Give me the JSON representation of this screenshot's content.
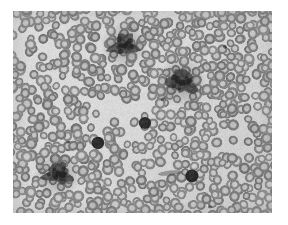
{
  "image": {
    "kind": "light-microscopy-photomicrograph",
    "subject": "peripheral blood smear",
    "title": "Peripheral blood smear photomicrograph",
    "alt_text": "Grayscale photomicrograph of a peripheral blood smear showing densely packed biconcave red blood cells with pale central pallor, several dark platelet clumps and a few small densely stained cells.",
    "color_mode": "grayscale",
    "canvas_width": 288,
    "canvas_height": 225,
    "border_color": "#ffffff",
    "plate": {
      "left": 13,
      "top": 11,
      "width": 259,
      "height": 202
    },
    "palette": {
      "page_background": "#ffffff",
      "field_background": "#dcdcda",
      "field_background_dark": "#c9c9c6",
      "rbc_rim": "#7e7e7c",
      "rbc_rim_dark": "#6a6a68",
      "rbc_center": "#bdbdbb",
      "dark_cell": "#2e2e2e",
      "clump": "#4a4a48",
      "vignette": "#b5b5b2"
    },
    "field": {
      "rbc_count": 780,
      "rbc_diameter_px": 10.5,
      "rbc_diameter_variation_px": 2.0,
      "seed": 20240517
    },
    "features": [
      {
        "id": "clump-top-center",
        "label": "platelet clump",
        "type": "clump",
        "x": 124,
        "y": 45,
        "rx": 13,
        "ry": 10,
        "rotation": -18,
        "darkness": 0.7
      },
      {
        "id": "clump-mid-right",
        "label": "platelet clump",
        "type": "clump",
        "x": 182,
        "y": 82,
        "rx": 14,
        "ry": 11,
        "rotation": 24,
        "darkness": 0.74
      },
      {
        "id": "clump-lower-left",
        "label": "platelet clump",
        "type": "clump",
        "x": 58,
        "y": 174,
        "rx": 13,
        "ry": 10,
        "rotation": 12,
        "darkness": 0.72
      },
      {
        "id": "dark-cell-center",
        "label": "densely stained cell",
        "type": "dark_cell",
        "x": 145,
        "y": 123,
        "rx": 6.2,
        "ry": 6.0,
        "rotation": 0,
        "darkness": 0.92
      },
      {
        "id": "dark-cell-left",
        "label": "densely stained cell",
        "type": "dark_cell",
        "x": 98,
        "y": 143,
        "rx": 6.4,
        "ry": 6.2,
        "rotation": 0,
        "darkness": 0.92
      },
      {
        "id": "dark-cell-lower-right",
        "label": "densely stained cell",
        "type": "dark_cell",
        "x": 192,
        "y": 176,
        "rx": 6.6,
        "ry": 6.4,
        "rotation": 0,
        "darkness": 0.93
      },
      {
        "id": "streak-lower-center",
        "label": "stain artifact streak",
        "type": "streak",
        "x": 170,
        "y": 173,
        "rx": 12,
        "ry": 2.5,
        "rotation": -6,
        "darkness": 0.45
      },
      {
        "id": "fleck-upper-right",
        "label": "stain fleck",
        "type": "fleck",
        "x": 225,
        "y": 47,
        "rx": 2.2,
        "ry": 1.6,
        "rotation": 30,
        "darkness": 0.6
      },
      {
        "id": "fleck-mid-center",
        "label": "stain fleck",
        "type": "fleck",
        "x": 163,
        "y": 99,
        "rx": 2.6,
        "ry": 1.4,
        "rotation": -40,
        "darkness": 0.55
      },
      {
        "id": "fleck-lower-center",
        "label": "stain fleck",
        "type": "fleck",
        "x": 68,
        "y": 142,
        "rx": 1.8,
        "ry": 1.3,
        "rotation": 10,
        "darkness": 0.5
      },
      {
        "id": "fleck-bottom",
        "label": "stain fleck",
        "type": "fleck",
        "x": 210,
        "y": 207,
        "rx": 2.0,
        "ry": 1.4,
        "rotation": 0,
        "darkness": 0.58
      }
    ],
    "pale_zones": [
      {
        "id": "pale-band-upper-left",
        "x": 36,
        "y": 52,
        "rx": 30,
        "ry": 16,
        "strength": 0.3
      },
      {
        "id": "pale-band-center",
        "x": 120,
        "y": 115,
        "rx": 42,
        "ry": 20,
        "strength": 0.26
      },
      {
        "id": "pale-band-lower-center",
        "x": 150,
        "y": 168,
        "rx": 36,
        "ry": 16,
        "strength": 0.3
      },
      {
        "id": "pale-band-right",
        "x": 236,
        "y": 140,
        "rx": 22,
        "ry": 24,
        "strength": 0.22
      }
    ],
    "dim_zones": [
      {
        "id": "dim-upper-right",
        "x": 215,
        "y": 30,
        "rx": 46,
        "ry": 26,
        "strength": 0.16
      },
      {
        "id": "dim-left-edge",
        "x": 10,
        "y": 120,
        "rx": 22,
        "ry": 60,
        "strength": 0.14
      },
      {
        "id": "dim-bottom-right",
        "x": 230,
        "y": 195,
        "rx": 38,
        "ry": 20,
        "strength": 0.14
      }
    ]
  }
}
